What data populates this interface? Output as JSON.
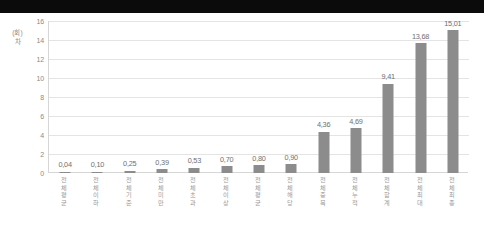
{
  "chart_data": {
    "type": "bar",
    "title": "",
    "xlabel": "",
    "ylabel": "(회) 차",
    "ylim": [
      0,
      16
    ],
    "ytick_labels": [
      "16",
      "14",
      "12",
      "10",
      "8",
      "6",
      "4",
      "2",
      "0"
    ],
    "ytick_values": [
      16,
      14,
      12,
      10,
      8,
      6,
      4,
      2,
      0
    ],
    "grid": true,
    "legend": "none",
    "bar_color": "#8c8c8c",
    "categories": [
      "전체 평균",
      "전체 이하",
      "전체 기준",
      "전체 미만",
      "전체 초과",
      "전체 이상",
      "전체 평균",
      "전체 해당",
      "전체 중복",
      "전체 누적",
      "전체 합계",
      "전체 최대",
      "전체 최종"
    ],
    "values": [
      0.04,
      0.1,
      0.25,
      0.39,
      0.53,
      0.7,
      0.8,
      0.9,
      4.36,
      4.69,
      9.41,
      13.68,
      15.01
    ],
    "value_labels": [
      "0,04",
      "0,10",
      "0,25",
      "0,39",
      "0,53",
      "0,70",
      "0,80",
      "0,90",
      "4,36",
      "4,69",
      "9,41",
      "13,68",
      "15,01"
    ]
  },
  "colors": {
    "top_bar": "#0b0b0b",
    "background": "#ffffff",
    "bar": "#8c8c8c",
    "gridline": "#e4e4e4",
    "axis": "#d6d6d6",
    "tick_text": "#8a8a8a"
  }
}
